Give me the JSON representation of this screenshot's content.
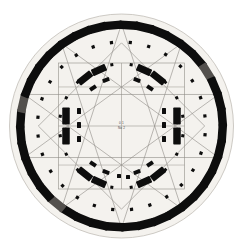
{
  "diagram": {
    "subtitle": "Geometric survey plan with construction lines",
    "center_label_line1": "0 1",
    "center_label_line2": "No 2",
    "background_color": "#ffffff",
    "disc_fill": "#f4f2ee",
    "stone_color": "#0d0d0d",
    "stone_color_faded": "#53504d",
    "line_color": "#8e8b86",
    "frame_color": "#9a9791"
  },
  "geometry": {
    "center_x": 121.5,
    "center_y": 126,
    "disc_radius": 112,
    "outer_ring_radius": 101,
    "inner_dot_ring_radius": 84,
    "second_dot_ring_radius": 64,
    "horseshoe_radius": 40,
    "square_half_width": 63,
    "outer_stone_count": 40,
    "outer_stone_length": 19,
    "outer_stone_width": 8.5,
    "entrance_gap_degrees": 7
  },
  "outer_ring": {
    "name": "sarsen-outer-circle",
    "stones": [
      {
        "angle": -86,
        "faded": false
      },
      {
        "angle": -77,
        "faded": false
      },
      {
        "angle": -68,
        "faded": false
      },
      {
        "angle": -59,
        "faded": false
      },
      {
        "angle": -50,
        "faded": false
      },
      {
        "angle": -41,
        "faded": false
      },
      {
        "angle": -32,
        "faded": true
      },
      {
        "angle": -23,
        "faded": false
      },
      {
        "angle": -14,
        "faded": false
      },
      {
        "angle": -5,
        "faded": false
      },
      {
        "angle": 4,
        "faded": false
      },
      {
        "angle": 13,
        "faded": false
      },
      {
        "angle": 22,
        "faded": false
      },
      {
        "angle": 31,
        "faded": false
      },
      {
        "angle": 40,
        "faded": false
      },
      {
        "angle": 49,
        "faded": false
      },
      {
        "angle": 58,
        "faded": false
      },
      {
        "angle": 67,
        "faded": false
      },
      {
        "angle": 76,
        "faded": false
      },
      {
        "angle": 85,
        "faded": false
      },
      {
        "angle": 94,
        "faded": false
      },
      {
        "angle": 103,
        "faded": false
      },
      {
        "angle": 112,
        "faded": false
      },
      {
        "angle": 121,
        "faded": false
      },
      {
        "angle": 130,
        "faded": true
      },
      {
        "angle": 139,
        "faded": false
      },
      {
        "angle": 148,
        "faded": false
      },
      {
        "angle": 157,
        "faded": false
      },
      {
        "angle": 166,
        "faded": false
      },
      {
        "angle": 175,
        "faded": false
      },
      {
        "angle": 184,
        "faded": false
      },
      {
        "angle": 193,
        "faded": true
      },
      {
        "angle": 202,
        "faded": false
      },
      {
        "angle": 211,
        "faded": false
      },
      {
        "angle": 220,
        "faded": false
      },
      {
        "angle": 229,
        "faded": false
      },
      {
        "angle": 238,
        "faded": false
      },
      {
        "angle": 247,
        "faded": false
      },
      {
        "angle": 256,
        "faded": false
      },
      {
        "angle": 265,
        "faded": false
      }
    ]
  },
  "trilithon_horseshoe": {
    "name": "trilithon-horseshoe",
    "stones": [
      {
        "cx": 66,
        "cy": 116,
        "w": 7.5,
        "h": 17,
        "rot": 0
      },
      {
        "cx": 66,
        "cy": 136,
        "w": 7.5,
        "h": 17,
        "rot": 0
      },
      {
        "cx": 177,
        "cy": 116,
        "w": 7.5,
        "h": 17,
        "rot": 0
      },
      {
        "cx": 177,
        "cy": 136,
        "w": 7.5,
        "h": 17,
        "rot": 0
      },
      {
        "cx": 85,
        "cy": 78,
        "w": 16,
        "h": 7,
        "rot": -38
      },
      {
        "cx": 99,
        "cy": 70,
        "w": 15,
        "h": 7,
        "rot": -24
      },
      {
        "cx": 158,
        "cy": 78,
        "w": 16,
        "h": 7,
        "rot": 38
      },
      {
        "cx": 144,
        "cy": 70,
        "w": 15,
        "h": 7,
        "rot": 24
      },
      {
        "cx": 85,
        "cy": 174,
        "w": 16,
        "h": 7,
        "rot": 38
      },
      {
        "cx": 99,
        "cy": 182,
        "w": 15,
        "h": 7,
        "rot": 24
      },
      {
        "cx": 158,
        "cy": 174,
        "w": 16,
        "h": 7,
        "rot": -38
      },
      {
        "cx": 144,
        "cy": 182,
        "w": 15,
        "h": 7,
        "rot": -24
      }
    ]
  },
  "bluestone_horseshoe": {
    "name": "bluestone-horseshoe",
    "stones": [
      {
        "cx": 79,
        "cy": 111,
        "w": 4,
        "h": 6,
        "rot": 0
      },
      {
        "cx": 79,
        "cy": 125,
        "w": 4,
        "h": 6,
        "rot": 0
      },
      {
        "cx": 79,
        "cy": 139,
        "w": 4,
        "h": 6,
        "rot": 0
      },
      {
        "cx": 164,
        "cy": 111,
        "w": 4,
        "h": 6,
        "rot": 0
      },
      {
        "cx": 164,
        "cy": 125,
        "w": 4,
        "h": 6,
        "rot": 0
      },
      {
        "cx": 164,
        "cy": 139,
        "w": 4,
        "h": 6,
        "rot": 0
      },
      {
        "cx": 93,
        "cy": 88,
        "w": 7,
        "h": 4,
        "rot": -35
      },
      {
        "cx": 106,
        "cy": 80,
        "w": 7,
        "h": 4,
        "rot": -20
      },
      {
        "cx": 150,
        "cy": 88,
        "w": 7,
        "h": 4,
        "rot": 35
      },
      {
        "cx": 137,
        "cy": 80,
        "w": 7,
        "h": 4,
        "rot": 20
      },
      {
        "cx": 93,
        "cy": 164,
        "w": 7,
        "h": 4,
        "rot": 35
      },
      {
        "cx": 106,
        "cy": 172,
        "w": 7,
        "h": 4,
        "rot": 20
      },
      {
        "cx": 150,
        "cy": 164,
        "w": 7,
        "h": 4,
        "rot": -35
      },
      {
        "cx": 137,
        "cy": 172,
        "w": 7,
        "h": 4,
        "rot": -20
      },
      {
        "cx": 119,
        "cy": 176,
        "w": 4,
        "h": 4,
        "rot": 0
      },
      {
        "cx": 128,
        "cy": 177,
        "w": 4,
        "h": 4,
        "rot": 0
      }
    ]
  },
  "hole_ring_outer": {
    "name": "aubrey-hole-ring",
    "radius": 84,
    "count": 28,
    "dot_size": 3.2,
    "start_angle": -84
  },
  "hole_ring_inner": {
    "name": "y-z-hole-ring",
    "radius": 62,
    "count": 20,
    "dot_size": 3.0,
    "start_angle": -81
  },
  "construction": {
    "name": "construction-geometry",
    "square_rotation_a": 0,
    "square_rotation_b": 45,
    "star_points": 5,
    "star_radius": 102,
    "axis_label_top": "entrance-axis"
  },
  "legend": {
    "north_marker": "N",
    "axis_marker": "axis"
  }
}
